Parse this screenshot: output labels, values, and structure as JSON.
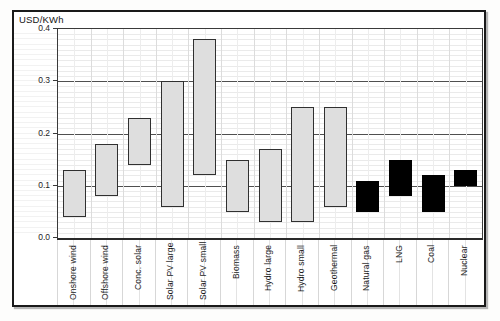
{
  "chart_data": {
    "type": "bar",
    "subtype": "floating_range_bars",
    "title": "USD/KWh",
    "ylabel": "USD/KWh",
    "xlabel": "",
    "ylim": [
      0,
      0.4
    ],
    "major_grid_step": 0.1,
    "minor_grid_step": 0.01,
    "grid": "horizontal major dark, horizontal minor light, vertical light half-category",
    "legend_position": "none",
    "yticks": [
      {
        "value": 0.0,
        "label": "0.0"
      },
      {
        "value": 0.1,
        "label": "0.1"
      },
      {
        "value": 0.2,
        "label": "0.2"
      },
      {
        "value": 0.3,
        "label": "0.3"
      },
      {
        "value": 0.4,
        "label": "0.4"
      }
    ],
    "categories": [
      "Onshore wind",
      "Offshore wind",
      "Conc. solar",
      "Solar PV large",
      "Solar PV small",
      "Biomass",
      "Hydro large",
      "Hydro small",
      "Geothermal",
      "Natural gas",
      "LNG",
      "Coal",
      "Nuclear"
    ],
    "bars": [
      {
        "label": "Onshore wind",
        "min": 0.04,
        "max": 0.13,
        "group": "renewable",
        "fill": "#dedede"
      },
      {
        "label": "Offshore wind",
        "min": 0.08,
        "max": 0.18,
        "group": "renewable",
        "fill": "#dedede"
      },
      {
        "label": "Conc. solar",
        "min": 0.14,
        "max": 0.23,
        "group": "renewable",
        "fill": "#dedede"
      },
      {
        "label": "Solar PV large",
        "min": 0.06,
        "max": 0.3,
        "group": "renewable",
        "fill": "#dedede"
      },
      {
        "label": "Solar PV small",
        "min": 0.12,
        "max": 0.38,
        "group": "renewable",
        "fill": "#dedede"
      },
      {
        "label": "Biomass",
        "min": 0.05,
        "max": 0.15,
        "group": "renewable",
        "fill": "#dedede"
      },
      {
        "label": "Hydro large",
        "min": 0.03,
        "max": 0.17,
        "group": "renewable",
        "fill": "#dedede"
      },
      {
        "label": "Hydro small",
        "min": 0.03,
        "max": 0.25,
        "group": "renewable",
        "fill": "#dedede"
      },
      {
        "label": "Geothermal",
        "min": 0.06,
        "max": 0.25,
        "group": "renewable",
        "fill": "#dedede"
      },
      {
        "label": "Natural gas",
        "min": 0.05,
        "max": 0.11,
        "group": "conventional",
        "fill": "#000000"
      },
      {
        "label": "LNG",
        "min": 0.08,
        "max": 0.15,
        "group": "conventional",
        "fill": "#000000"
      },
      {
        "label": "Coal",
        "min": 0.05,
        "max": 0.12,
        "group": "conventional",
        "fill": "#000000"
      },
      {
        "label": "Nuclear",
        "min": 0.1,
        "max": 0.13,
        "group": "conventional",
        "fill": "#000000"
      }
    ],
    "colors": {
      "renewable_fill": "#dedede",
      "conventional_fill": "#000000",
      "bar_border": "#303030",
      "frame_border": "#1a1a1a",
      "major_gridline": "#4f4f4f",
      "minor_gridline": "#eaeaea"
    }
  }
}
